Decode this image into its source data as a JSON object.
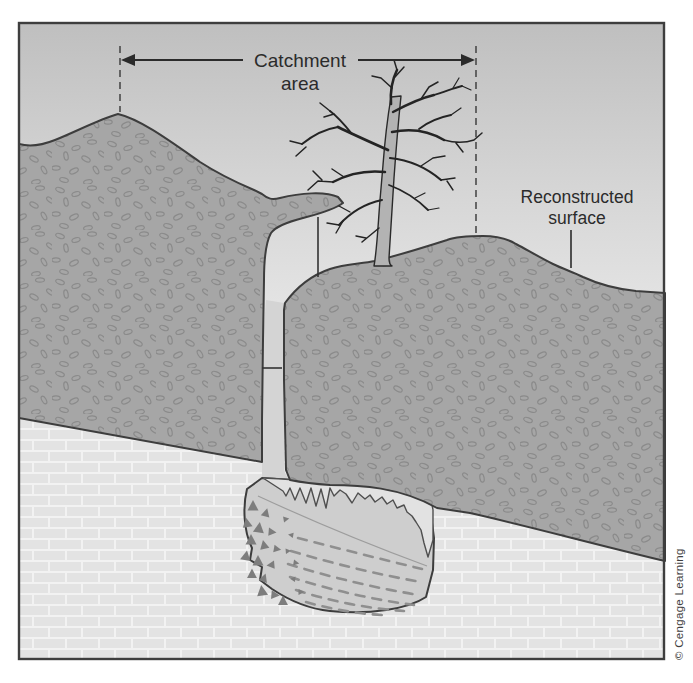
{
  "figure": {
    "type": "geological-cross-section-diagram",
    "labels": {
      "catchment": {
        "line1": "Catchment",
        "line2": "area"
      },
      "reconstructed": {
        "line1": "Reconstructed",
        "line2": "surface"
      }
    },
    "credit": "© Cengage Learning",
    "textures": {
      "sediment_fill": "pebble-stipple",
      "bedrock_fill": "limestone-brick",
      "pit_left_markers": "triangle-clasts",
      "pit_right_markers": "dashed-laminae"
    },
    "colors": {
      "sky_top": "#bfbfbf",
      "sky_mid": "#d7d7d7",
      "sky_bottom": "#eaeaea",
      "sediment": "#a6a6a6",
      "pebble_outline": "#8a8a8a",
      "outline": "#3d3d3d",
      "bedrock_mortar": "#f2f2f2",
      "bedrock_brick": "#e3e3e3",
      "shaft_fill": "#d4d4d4",
      "pit_fill": "#cecece",
      "pit_upper_fill": "#e2e2e2",
      "clast_marker": "#7d7d7d",
      "lamina_marker": "#8f8f8f",
      "trunk_fill": "#b3b3b3",
      "annotation": "#2b2b2b"
    }
  }
}
